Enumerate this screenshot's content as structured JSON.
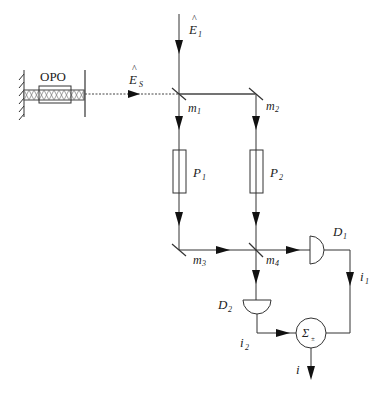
{
  "diagram": {
    "title": "",
    "components": {
      "opo": {
        "label": "OPO"
      },
      "input_field": {
        "label": "E",
        "sub": "1",
        "hat": "^"
      },
      "signal_field": {
        "label": "E",
        "sub": "S",
        "hat": "^"
      },
      "mirrors": [
        {
          "label": "m",
          "sub": "1"
        },
        {
          "label": "m",
          "sub": "2"
        },
        {
          "label": "m",
          "sub": "3"
        },
        {
          "label": "m",
          "sub": "4"
        }
      ],
      "phase_plates": [
        {
          "label": "P",
          "sub": "1"
        },
        {
          "label": "P",
          "sub": "2"
        }
      ],
      "detectors": [
        {
          "label": "D",
          "sub": "1"
        },
        {
          "label": "D",
          "sub": "2"
        }
      ],
      "currents": [
        {
          "label": "i",
          "sub": "1"
        },
        {
          "label": "i",
          "sub": "2"
        }
      ],
      "summer": {
        "label": "Σ",
        "sub": "±"
      },
      "output": {
        "label": "i"
      }
    }
  }
}
